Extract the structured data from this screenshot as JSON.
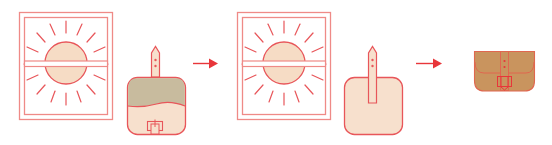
{
  "diagram": {
    "description": "Sun-tanning a leather pouch in a window: step sequence",
    "steps": [
      {
        "id": "step-1",
        "label": "Pouch with flap closed placed in sunny window",
        "elements": [
          "window-with-sun",
          "pouch-flap-closed"
        ]
      },
      {
        "id": "step-2",
        "label": "Pouch opened flat, placed in sunny window",
        "elements": [
          "window-with-sun",
          "pouch-open-flat"
        ]
      },
      {
        "id": "step-3",
        "label": "Evenly tanned pouch",
        "elements": [
          "pouch-tanned"
        ]
      }
    ],
    "arrows": [
      {
        "from": "step-1",
        "to": "step-2"
      },
      {
        "from": "step-2",
        "to": "step-3"
      }
    ]
  },
  "colors": {
    "line": "#e8565a",
    "line_light": "#ef8a87",
    "sun_fill": "#f6dcc5",
    "flap_fill": "#c8bb9e",
    "pouch_light": "#f7e0cd",
    "pouch_tanned": "#c9945e",
    "arrow": "#e8363a",
    "background": "#ffffff"
  },
  "labels": {
    "window": "Sunny window",
    "sun": "Sun",
    "pouch_closed": "Leather pouch (closed)",
    "pouch_open": "Leather pouch (open)",
    "pouch_tanned": "Tanned leather pouch"
  }
}
